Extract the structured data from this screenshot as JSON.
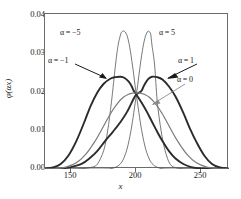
{
  "chart_data": {
    "type": "line",
    "title": "",
    "xlabel": "x",
    "ylabel": "φ(αx)",
    "xlim": [
      130,
      271
    ],
    "ylim": [
      0.0,
      0.04
    ],
    "xticks": [
      150,
      200,
      250
    ],
    "xticklabels": [
      "150",
      "200",
      "250"
    ],
    "yticks": [
      0.0,
      0.01,
      0.02,
      0.03,
      0.04
    ],
    "yticklabels": [
      "0.00",
      "0.01",
      "0.02",
      "0.03",
      "0.04"
    ],
    "grid": false,
    "legend_position": "inline-annotations",
    "crossing_point": {
      "x": 200,
      "y": 0.0192
    },
    "series": [
      {
        "name": "α = -5",
        "label": "α = −5",
        "color": "#555555",
        "linewidth": 0.8,
        "peak_x": 191,
        "peak_y": 0.0355,
        "x": [
          130,
          140,
          150,
          158,
          165,
          170,
          175,
          178,
          181,
          184,
          186,
          188,
          189,
          190,
          191,
          192,
          193,
          194,
          195,
          196,
          197,
          198,
          199,
          200,
          201,
          203,
          205,
          208,
          212,
          218,
          225,
          235,
          250,
          271
        ],
        "y": [
          0.0,
          0.0,
          0.0,
          0.0001,
          0.0004,
          0.0012,
          0.0048,
          0.0098,
          0.0175,
          0.0268,
          0.0319,
          0.0348,
          0.0354,
          0.0356,
          0.0355,
          0.0351,
          0.0343,
          0.033,
          0.0313,
          0.0292,
          0.0268,
          0.0243,
          0.0216,
          0.0192,
          0.0168,
          0.0122,
          0.0083,
          0.0042,
          0.0014,
          0.0002,
          0.0,
          0.0,
          0.0,
          0.0
        ]
      },
      {
        "name": "α = 5",
        "label": "α = 5",
        "color": "#555555",
        "linewidth": 0.8,
        "peak_x": 209,
        "peak_y": 0.0355,
        "x": [
          130,
          150,
          165,
          175,
          182,
          188,
          192,
          195,
          197,
          199,
          200,
          201,
          202,
          203,
          204,
          205,
          206,
          207,
          208,
          209,
          210,
          211,
          212,
          214,
          216,
          219,
          222,
          226,
          232,
          242,
          256,
          271
        ],
        "y": [
          0.0,
          0.0,
          0.0,
          0.0,
          0.0002,
          0.0014,
          0.0042,
          0.0083,
          0.0122,
          0.0168,
          0.0192,
          0.0216,
          0.0243,
          0.0268,
          0.0292,
          0.0313,
          0.033,
          0.0343,
          0.0351,
          0.0356,
          0.0354,
          0.0348,
          0.0319,
          0.0268,
          0.0175,
          0.0098,
          0.0048,
          0.0012,
          0.0002,
          0.0,
          0.0,
          0.0
        ]
      },
      {
        "name": "α = -1",
        "label": "α = −1",
        "color": "#2b2b2b",
        "linewidth": 1.9,
        "peak_x": 188,
        "peak_y": 0.0238,
        "x": [
          130,
          136,
          142,
          148,
          154,
          160,
          165,
          170,
          175,
          180,
          184,
          188,
          191,
          194,
          196,
          198,
          199,
          200,
          202,
          205,
          208,
          212,
          216,
          220,
          225,
          230,
          236,
          242,
          250,
          258,
          265,
          271
        ],
        "y": [
          0.0001,
          0.0004,
          0.0013,
          0.0035,
          0.0072,
          0.012,
          0.0163,
          0.0197,
          0.022,
          0.0233,
          0.0237,
          0.0238,
          0.0235,
          0.0226,
          0.0216,
          0.0202,
          0.0197,
          0.0192,
          0.0182,
          0.0166,
          0.0148,
          0.0122,
          0.0096,
          0.0072,
          0.0046,
          0.0027,
          0.0013,
          0.0005,
          0.0001,
          0.0,
          0.0,
          0.0
        ]
      },
      {
        "name": "α = 1",
        "label": "α = 1",
        "color": "#2b2b2b",
        "linewidth": 1.9,
        "peak_x": 212,
        "peak_y": 0.0238,
        "x": [
          130,
          136,
          142,
          150,
          158,
          164,
          170,
          176,
          182,
          188,
          193,
          198,
          200,
          202,
          204,
          206,
          209,
          212,
          216,
          220,
          225,
          230,
          236,
          241,
          246,
          252,
          258,
          264,
          271
        ],
        "y": [
          0.0,
          0.0,
          0.0001,
          0.0005,
          0.0013,
          0.0027,
          0.0046,
          0.0072,
          0.0096,
          0.0122,
          0.0148,
          0.0182,
          0.0192,
          0.0197,
          0.0202,
          0.0216,
          0.0232,
          0.0238,
          0.0237,
          0.0231,
          0.0213,
          0.0187,
          0.0145,
          0.0105,
          0.007,
          0.0035,
          0.0013,
          0.0004,
          0.0001
        ]
      },
      {
        "name": "α = 0",
        "label": "α = 0",
        "color": "#7a7a7a",
        "linewidth": 1.2,
        "peak_x": 200,
        "peak_y": 0.0196,
        "x": [
          130,
          138,
          146,
          154,
          161,
          168,
          174,
          180,
          185,
          190,
          194,
          197,
          200,
          203,
          206,
          210,
          215,
          220,
          226,
          232,
          239,
          246,
          254,
          262,
          271
        ],
        "y": [
          0.0,
          0.0001,
          0.0005,
          0.0016,
          0.0037,
          0.007,
          0.0105,
          0.0142,
          0.0167,
          0.0185,
          0.0193,
          0.0196,
          0.0196,
          0.0196,
          0.0193,
          0.0185,
          0.0167,
          0.0142,
          0.0105,
          0.007,
          0.0037,
          0.0016,
          0.0005,
          0.0001,
          0.0
        ]
      }
    ],
    "annotations": [
      {
        "text": "α = −5",
        "at_x": 160,
        "at_y": 0.0375,
        "arrow": false
      },
      {
        "text": "α = −1",
        "at_x": 148,
        "at_y": 0.03,
        "arrow": true
      },
      {
        "text": "α = 5",
        "at_x": 225,
        "at_y": 0.0375,
        "arrow": false
      },
      {
        "text": "α = 1",
        "at_x": 243,
        "at_y": 0.03,
        "arrow": true
      },
      {
        "text": "α = 0",
        "at_x": 243,
        "at_y": 0.025,
        "arrow": true
      }
    ]
  },
  "axes": {
    "y_tick_labels": [
      "0.04",
      "0.03",
      "0.02",
      "0.01",
      "0.00"
    ],
    "x_tick_labels": [
      "150",
      "200",
      "250"
    ],
    "x_title": "x",
    "y_title_phi": "φ",
    "y_title_arg": "(αx)"
  },
  "annotations": {
    "alpha_minus5": "α = −5",
    "alpha_minus1": "α = −1",
    "alpha_5": "α = 5",
    "alpha_1": "α = 1",
    "alpha_0": "α = 0"
  },
  "colors": {
    "frame": "#6b6b6b",
    "curve_thin": "#555555",
    "curve_thick": "#2b2b2b",
    "curve_mid": "#7a7a7a",
    "text": "#1a1a1a",
    "background": "#ffffff"
  }
}
